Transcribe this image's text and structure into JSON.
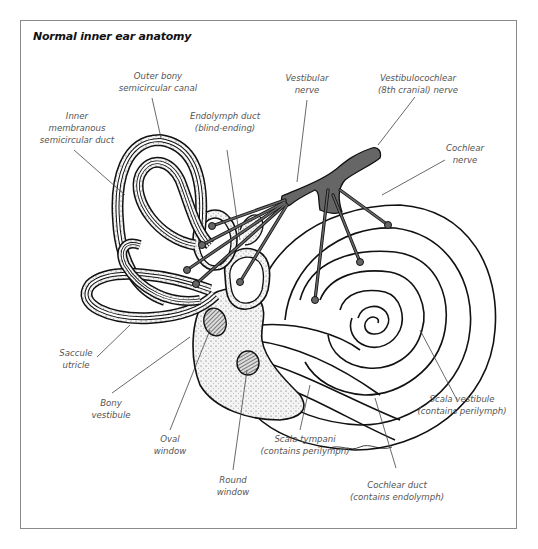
{
  "title": "Normal inner ear anatomy",
  "colors": {
    "border": "#8a8a8a",
    "line": "#111111",
    "nerve_fill": "#666666",
    "label_text": "#555555",
    "background": "#ffffff",
    "stipple_fill": "#f2f2f2"
  },
  "labels": {
    "outer_bony_canal": {
      "line1": "Outer bony",
      "line2": "semicircular canal"
    },
    "inner_membranous_duct": {
      "line1": "Inner",
      "line2": "membranous",
      "line3": "semicircular duct"
    },
    "endolymph_duct": {
      "line1": "Endolymph duct",
      "line2": "(blind-ending)"
    },
    "vestibular_nerve": {
      "line1": "Vestibular",
      "line2": "nerve"
    },
    "vestibulocochlear_nerve": {
      "line1": "Vestibulocochlear",
      "line2": "(8th cranial) nerve"
    },
    "cochlear_nerve": {
      "line1": "Cochlear",
      "line2": "nerve"
    },
    "saccule_utricle": {
      "line1": "Saccule",
      "line2": "utricle"
    },
    "bony_vestibule": {
      "line1": "Bony",
      "line2": "vestibule"
    },
    "oval_window": {
      "line1": "Oval",
      "line2": "window"
    },
    "round_window": {
      "line1": "Round",
      "line2": "window"
    },
    "scala_tympani": {
      "line1": "Scala tympani",
      "line2": "(contains perilymph)"
    },
    "scala_vestibule": {
      "line1": "Scala vestibule",
      "line2": "(contains perilymph)"
    },
    "cochlear_duct": {
      "line1": "Cochlear duct",
      "line2": "(contains endolymph)"
    }
  }
}
